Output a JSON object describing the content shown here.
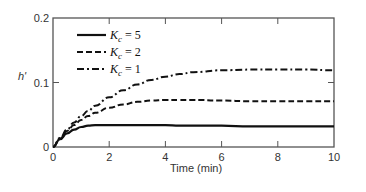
{
  "chart_data": {
    "type": "line",
    "title": "",
    "xlabel": "Time (min)",
    "ylabel": "h'",
    "xlim": [
      0,
      10
    ],
    "ylim": [
      0,
      0.2
    ],
    "xticks": [
      0,
      2,
      4,
      6,
      8,
      10
    ],
    "xtick_labels": [
      "0",
      "2",
      "4",
      "6",
      "8",
      "10"
    ],
    "yticks": [
      0,
      0.1,
      0.2
    ],
    "ytick_labels": [
      "0",
      "0.1",
      "0.2"
    ],
    "grid": false,
    "legend_position": "upper left",
    "x": [
      0,
      0.25,
      0.5,
      0.75,
      1.0,
      1.25,
      1.5,
      2,
      2.5,
      3,
      3.5,
      4,
      4.5,
      5,
      6,
      7,
      8,
      9,
      10
    ],
    "series": [
      {
        "name": "Kc = 5",
        "style": "solid",
        "values": [
          0,
          0.012,
          0.021,
          0.027,
          0.031,
          0.033,
          0.034,
          0.034,
          0.034,
          0.034,
          0.034,
          0.034,
          0.033,
          0.033,
          0.033,
          0.032,
          0.032,
          0.032,
          0.032
        ]
      },
      {
        "name": "Kc = 2",
        "style": "dashed",
        "values": [
          0,
          0.013,
          0.025,
          0.034,
          0.042,
          0.048,
          0.053,
          0.061,
          0.066,
          0.07,
          0.072,
          0.073,
          0.073,
          0.073,
          0.072,
          0.071,
          0.071,
          0.071,
          0.071
        ]
      },
      {
        "name": "Kc = 1",
        "style": "dashdot",
        "values": [
          0,
          0.014,
          0.027,
          0.038,
          0.048,
          0.056,
          0.064,
          0.077,
          0.088,
          0.097,
          0.104,
          0.109,
          0.113,
          0.116,
          0.119,
          0.12,
          0.12,
          0.12,
          0.119
        ]
      }
    ]
  },
  "legend": {
    "items": [
      {
        "symbol": "K",
        "sub": "c",
        "rest": " = 5"
      },
      {
        "symbol": "K",
        "sub": "c",
        "rest": " = 2"
      },
      {
        "symbol": "K",
        "sub": "c",
        "rest": " = 1"
      }
    ]
  },
  "colors": {
    "line": "#111111",
    "axis": "#555555"
  }
}
